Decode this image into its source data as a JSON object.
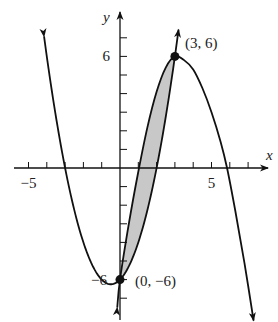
{
  "chart_data": {
    "type": "line",
    "title": "",
    "xlabel": "x",
    "ylabel": "y",
    "xlim": [
      -6.5,
      8.5
    ],
    "ylim": [
      -8.5,
      9
    ],
    "x_ticks": [
      -5,
      -4,
      -3,
      -2,
      -1,
      1,
      2,
      3,
      4,
      5,
      6,
      7
    ],
    "y_ticks": [
      -7,
      -6,
      -5,
      -4,
      -3,
      -2,
      -1,
      1,
      2,
      3,
      4,
      5,
      6,
      7
    ],
    "x_tick_labels": [
      {
        "value": -5,
        "text": "−5"
      },
      {
        "value": 5,
        "text": "5"
      }
    ],
    "y_tick_labels": [
      {
        "value": 6,
        "text": "6"
      },
      {
        "value": -6,
        "text": "−6"
      }
    ],
    "series": [
      {
        "name": "parabola",
        "equation": "y = x^2 + x - 6",
        "x_range": [
          -4.15,
          3.2
        ],
        "arrows": "both-up"
      },
      {
        "name": "peaked-curve",
        "points": [
          [
            -0.15,
            -7.5
          ],
          [
            0,
            -6
          ],
          [
            0.5,
            -2.9
          ],
          [
            1,
            -0.2
          ],
          [
            1.5,
            2.2
          ],
          [
            2,
            4.1
          ],
          [
            2.5,
            5.4
          ],
          [
            3,
            6
          ],
          [
            3.5,
            5.8
          ],
          [
            4,
            5.3
          ],
          [
            4.5,
            4.3
          ],
          [
            5,
            3.0
          ],
          [
            5.5,
            1.4
          ],
          [
            5.85,
            0
          ],
          [
            6.3,
            -2.3
          ],
          [
            6.8,
            -5.1
          ],
          [
            7.3,
            -8.2
          ]
        ],
        "arrows": "both-down"
      }
    ],
    "shaded_region": {
      "between": [
        "peaked-curve",
        "parabola"
      ],
      "x_range": [
        0,
        3
      ],
      "color": "#c8c8c8"
    },
    "annotations": [
      {
        "text": "(3, 6)",
        "x": 3,
        "y": 6
      },
      {
        "text": "(0, −6)",
        "x": 0,
        "y": -6
      }
    ],
    "points": [
      [
        3,
        6
      ],
      [
        0,
        -6
      ]
    ],
    "grid": false,
    "legend": "none"
  }
}
